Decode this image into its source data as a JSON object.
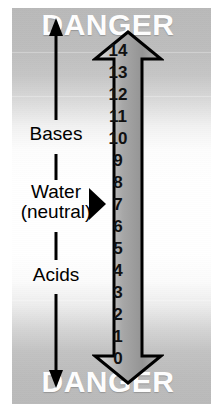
{
  "diagram": {
    "top_warning": "DANGER",
    "bottom_warning": "DANGER",
    "region_labels": {
      "bases": "Bases",
      "water_line1": "Water",
      "water_line2": "(neutral)",
      "acids": "Acids"
    },
    "scale": {
      "orientation": "vertical",
      "top_value": "14",
      "bottom_value": "0",
      "neutral_value": "7",
      "values": [
        "14",
        "13",
        "12",
        "11",
        "10",
        "9",
        "8",
        "7",
        "6",
        "5",
        "4",
        "3",
        "2",
        "1",
        "0"
      ]
    },
    "colors": {
      "text": "#000000",
      "warning_text": "#ffffff",
      "pointer": "#000000",
      "scale_outline": "#000000",
      "scale_fill_light": "#d6d6d6",
      "scale_fill_dark": "#8e8e8e",
      "background_gray": "#bbbbbb",
      "background_white": "#ffffff"
    }
  }
}
